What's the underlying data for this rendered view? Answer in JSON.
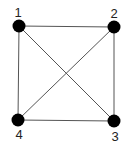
{
  "diagram": {
    "type": "graph",
    "colors": {
      "node": "#000000",
      "edge": "#555555",
      "label": "#222222",
      "background": "#ffffff"
    },
    "nodes": [
      {
        "id": "1",
        "label": "1",
        "x": 19,
        "y": 26,
        "label_x": 18,
        "label_y": 17
      },
      {
        "id": "2",
        "label": "2",
        "x": 114,
        "y": 27,
        "label_x": 114,
        "label_y": 18
      },
      {
        "id": "3",
        "label": "3",
        "x": 114,
        "y": 121,
        "label_x": 115,
        "label_y": 141
      },
      {
        "id": "4",
        "label": "4",
        "x": 18,
        "y": 120,
        "label_x": 19,
        "label_y": 139
      }
    ],
    "edges": [
      {
        "from": "1",
        "to": "2"
      },
      {
        "from": "2",
        "to": "3"
      },
      {
        "from": "3",
        "to": "4"
      },
      {
        "from": "4",
        "to": "1"
      },
      {
        "from": "1",
        "to": "3"
      },
      {
        "from": "2",
        "to": "4"
      }
    ]
  }
}
